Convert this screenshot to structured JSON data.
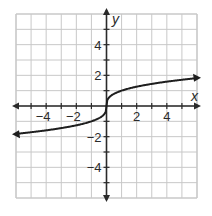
{
  "chart_data": {
    "type": "line",
    "title": "",
    "xlabel": "x",
    "ylabel": "y",
    "xlim": [
      -6,
      6
    ],
    "ylim": [
      -6,
      6
    ],
    "grid": true,
    "x_ticks": [
      -4,
      -2,
      2,
      4
    ],
    "y_ticks": [
      4,
      2,
      -2,
      -4
    ],
    "x_tick_labels": [
      "−4",
      "−2",
      "2",
      "4"
    ],
    "y_tick_labels": [
      "4",
      "2",
      "−2",
      "−4"
    ],
    "series": [
      {
        "name": "y = cube root of x",
        "x": [
          -6,
          -5,
          -4,
          -3,
          -2,
          -1,
          -0.5,
          -0.1,
          0,
          0.1,
          0.5,
          1,
          2,
          3,
          4,
          5,
          6
        ],
        "y": [
          -1.82,
          -1.71,
          -1.59,
          -1.44,
          -1.26,
          -1.0,
          -0.79,
          -0.46,
          0,
          0.46,
          0.79,
          1.0,
          1.26,
          1.44,
          1.59,
          1.71,
          1.82
        ],
        "arrows": "both ends"
      }
    ]
  },
  "colors": {
    "grid": "#c8c8c8",
    "axis": "#2a2a2a",
    "curve": "#1e1e1e",
    "background": "#ffffff"
  }
}
